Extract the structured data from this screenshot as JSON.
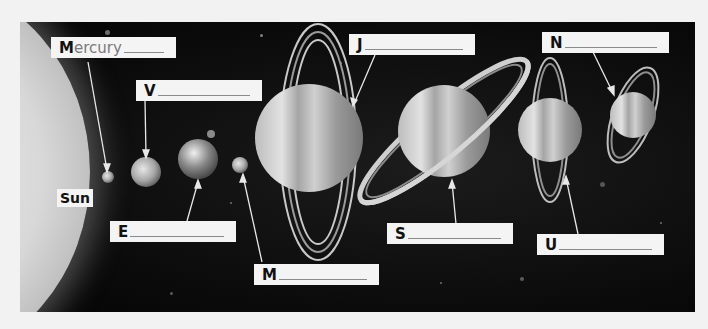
{
  "diagram": {
    "background_color": "#0b0b0b",
    "sun": {
      "label": "Sun"
    },
    "labels": [
      {
        "id": "mercury",
        "letter": "M",
        "hint": "ercury",
        "answer_filled": true
      },
      {
        "id": "venus",
        "letter": "V",
        "hint": "",
        "answer_filled": false
      },
      {
        "id": "earth",
        "letter": "E",
        "hint": "",
        "answer_filled": false
      },
      {
        "id": "mars",
        "letter": "M",
        "hint": "",
        "answer_filled": false
      },
      {
        "id": "jupiter",
        "letter": "J",
        "hint": "",
        "answer_filled": false
      },
      {
        "id": "saturn",
        "letter": "S",
        "hint": "",
        "answer_filled": false
      },
      {
        "id": "uranus",
        "letter": "U",
        "hint": "",
        "answer_filled": false
      },
      {
        "id": "neptune",
        "letter": "N",
        "hint": "",
        "answer_filled": false
      }
    ],
    "planets_order": [
      "Mercury",
      "Venus",
      "Earth",
      "Mars",
      "Jupiter",
      "Saturn",
      "Uranus",
      "Neptune"
    ]
  }
}
